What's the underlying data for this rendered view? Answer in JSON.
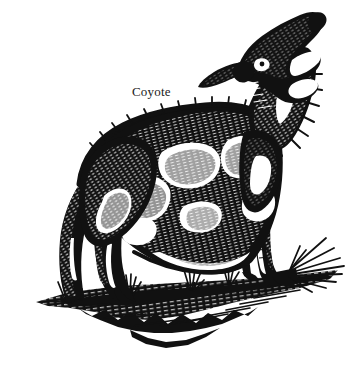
{
  "figure": {
    "subject": "Coyote",
    "caption": "Coyote",
    "style": "black-and-white pen-and-ink line engraving",
    "background_color": "#ffffff",
    "ink_color": "#111111",
    "caption_color": "#1b1b1b",
    "width": 356,
    "height": 370
  },
  "caption": {
    "text": "Coyote",
    "x": 132,
    "y": 84
  },
  "scene": {
    "animal_pose": "standing, head raised, howling",
    "ground_description": "grassy ground with cast shadow",
    "elements": [
      {
        "name": "head",
        "label": "howling head"
      },
      {
        "name": "muzzle",
        "label": "open muzzle"
      },
      {
        "name": "ear",
        "label": "pointed ear"
      },
      {
        "name": "eye",
        "label": "eye"
      },
      {
        "name": "neck-ruff",
        "label": "neck ruff"
      },
      {
        "name": "body",
        "label": "body"
      },
      {
        "name": "back",
        "label": "arched back"
      },
      {
        "name": "foreleg",
        "label": "foreleg"
      },
      {
        "name": "hind-leg",
        "label": "hind leg"
      },
      {
        "name": "tail",
        "label": "tail"
      },
      {
        "name": "grass-tuft",
        "label": "grass tuft"
      },
      {
        "name": "ground-shadow",
        "label": "ground shadow"
      }
    ]
  }
}
